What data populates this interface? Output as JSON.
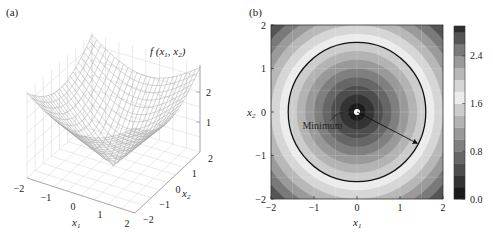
{
  "figure": {
    "panel_a_label": "(a)",
    "panel_b_label": "(b)"
  },
  "chart_data": [
    {
      "type": "surface3d",
      "panel": "(a)",
      "title": "",
      "zlabel": "f(x1, x2)",
      "zlabel_parts": {
        "f": "f",
        "open": "(",
        "x1": "x",
        "sub1": "1",
        "comma": ", ",
        "x2": "x",
        "sub2": "2",
        "close": ")"
      },
      "xlabel": "x1",
      "ylabel": "x2",
      "x_ticks": [
        -2,
        -1,
        0,
        1,
        2
      ],
      "y_ticks": [
        -2,
        -1,
        0,
        1,
        2
      ],
      "z_ticks": [
        1,
        2
      ],
      "xlim": [
        -2,
        2
      ],
      "ylim": [
        -2,
        2
      ],
      "zlim": [
        0,
        2.83
      ],
      "surface": "f = sqrt(x1^2 + x2^2) (cone-like bowl, minimum 0 at origin, max ~2.83 at corners)",
      "style": "grey wireframe mesh",
      "grid": true
    },
    {
      "type": "heatmap",
      "subtype": "filled_contour",
      "panel": "(b)",
      "title": "",
      "xlabel": "x1",
      "ylabel": "x2",
      "xlim": [
        -2,
        2
      ],
      "ylim": [
        -2,
        2
      ],
      "x_ticks": [
        -2,
        -1,
        0,
        1,
        2
      ],
      "y_ticks": [
        -2,
        -1,
        0,
        1,
        2
      ],
      "colorbar": {
        "ticks": [
          0.0,
          0.8,
          1.6,
          2.4
        ],
        "tick_labels": [
          "0.0",
          "0.8",
          "1.6",
          "2.4"
        ],
        "range": [
          0.0,
          2.9
        ],
        "levels": [
          0.0,
          0.2,
          0.4,
          0.6,
          0.8,
          1.0,
          1.2,
          1.4,
          1.6,
          1.8,
          2.0,
          2.2,
          2.4,
          2.6,
          2.8
        ],
        "colors": [
          "#1a1a1a",
          "#333333",
          "#4d4d4d",
          "#666666",
          "#7f7f7f",
          "#999999",
          "#b3b3b3",
          "#cccccc",
          "#ececec",
          "#d6d6d6",
          "#b8b8b8",
          "#9a9a9a",
          "#7a7a7a",
          "#555555",
          "#2e2e2e"
        ]
      },
      "annotations": [
        {
          "text": "Minimum",
          "x": -0.85,
          "y": -0.35,
          "points_to": [
            0,
            0
          ]
        },
        {
          "type": "circle",
          "center": [
            0,
            0
          ],
          "radius": 1.6,
          "color": "#111111"
        },
        {
          "type": "arrow",
          "from": [
            0,
            0
          ],
          "to": [
            1.4,
            -0.72
          ]
        }
      ],
      "grid": true
    }
  ]
}
